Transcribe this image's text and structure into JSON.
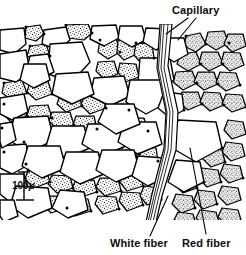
{
  "figure": {
    "ink_color": "#000000",
    "background_color": "#ffffff",
    "stipple_color": "#1a1a1a"
  },
  "labels": {
    "capillary": "Capillary",
    "white_fiber": "White fiber",
    "red_fiber": "Red fiber"
  },
  "scale_bar": {
    "value": "100",
    "unit": "μ",
    "full_text": "100 μ"
  },
  "legend_semantics": {
    "white_fiber_fill": "unshaded / plain outline polygon",
    "red_fiber_fill": "stippled / dotted polygon",
    "capillary_fill": "narrow band of parallel lines"
  }
}
